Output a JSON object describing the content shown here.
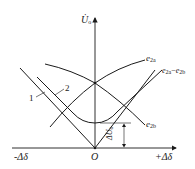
{
  "diagram": {
    "axes": {
      "y_label": "U̇",
      "y_label_sub": "o",
      "x_neg_label": "-Δδ",
      "x_pos_label": "+Δδ",
      "origin_label": "O"
    },
    "curves": {
      "e2a": {
        "label": "e",
        "sub": "2a"
      },
      "e2b": {
        "label": "e",
        "sub": "2b"
      },
      "diff": {
        "label": "e",
        "sub": "2a",
        "minus": "−",
        "label2": "e",
        "sub2": "2b"
      }
    },
    "markers": {
      "line1": "1",
      "line2": "2",
      "delta_u": "ΔU",
      "delta_u_sub": "o"
    },
    "colors": {
      "stroke": "#1a1a1a",
      "background": "#ffffff"
    }
  }
}
